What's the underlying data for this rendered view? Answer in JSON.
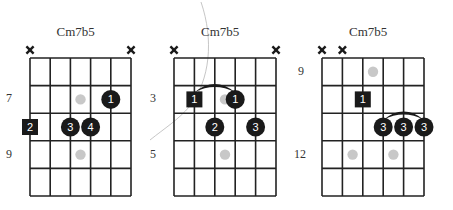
{
  "colors": {
    "grid": "#222222",
    "finger": "#1a1a1a",
    "finger_text": "#ffffff",
    "ghost_dot": "#c8c8c8",
    "x_mark": "#1a1a1a"
  },
  "diagrams": [
    {
      "title": "Cm7b5",
      "left": 30,
      "top": 58,
      "string_gap": 20.2,
      "fret_gap": 27.6,
      "muted_strings": [
        0,
        5
      ],
      "fret_labels": [
        {
          "label": "7",
          "row": 1
        },
        {
          "label": "9",
          "row": 3
        }
      ],
      "fingers": [
        {
          "string": 4,
          "row": 1,
          "label": "1",
          "shape": "circle"
        },
        {
          "string": 0,
          "row": 2,
          "label": "2",
          "shape": "square"
        },
        {
          "string": 2,
          "row": 2,
          "label": "3",
          "shape": "circle"
        },
        {
          "string": 3,
          "row": 2,
          "label": "4",
          "shape": "circle"
        }
      ],
      "ghost_dots": [
        {
          "string": 2.5,
          "row": 1
        },
        {
          "string": 2.5,
          "row": 3
        }
      ],
      "barre": null
    },
    {
      "title": "Cm7b5",
      "left": 174,
      "top": 58,
      "string_gap": 20.4,
      "fret_gap": 27.6,
      "muted_strings": [
        0,
        5
      ],
      "fret_labels": [
        {
          "label": "3",
          "row": 1
        },
        {
          "label": "5",
          "row": 3
        }
      ],
      "fingers": [
        {
          "string": 1,
          "row": 1,
          "label": "1",
          "shape": "square"
        },
        {
          "string": 3,
          "row": 1,
          "label": "1",
          "shape": "circle"
        },
        {
          "string": 2,
          "row": 2,
          "label": "2",
          "shape": "circle"
        },
        {
          "string": 4,
          "row": 2,
          "label": "3",
          "shape": "circle"
        }
      ],
      "ghost_dots": [
        {
          "string": 2.5,
          "row": 1
        },
        {
          "string": 2.5,
          "row": 3
        }
      ],
      "barre": {
        "from": 1,
        "to": 3,
        "row": 1
      }
    },
    {
      "title": "Cm7b5",
      "left": 322,
      "top": 58,
      "string_gap": 20.4,
      "fret_gap": 27.6,
      "muted_strings": [
        0,
        1
      ],
      "fret_labels": [
        {
          "label": "9",
          "row": 0
        },
        {
          "label": "12",
          "row": 3
        }
      ],
      "fingers": [
        {
          "string": 2,
          "row": 1,
          "label": "1",
          "shape": "square"
        },
        {
          "string": 3,
          "row": 2,
          "label": "3",
          "shape": "circle"
        },
        {
          "string": 4,
          "row": 2,
          "label": "3",
          "shape": "circle"
        },
        {
          "string": 5,
          "row": 2,
          "label": "3",
          "shape": "circle"
        }
      ],
      "ghost_dots": [
        {
          "string": 2.5,
          "row": 0
        },
        {
          "string": 1.5,
          "row": 3
        },
        {
          "string": 3.5,
          "row": 3
        }
      ],
      "barre": {
        "from": 3,
        "to": 5,
        "row": 2
      }
    }
  ]
}
